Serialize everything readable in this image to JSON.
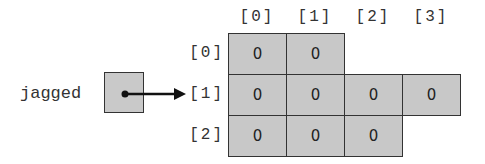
{
  "diagram": {
    "variable_name": "jagged",
    "column_headers": [
      "[0]",
      "[1]",
      "[2]",
      "[3]"
    ],
    "row_labels": [
      "[0]",
      "[1]",
      "[2]"
    ],
    "rows": [
      [
        "0",
        "0"
      ],
      [
        "0",
        "0",
        "0",
        "0"
      ],
      [
        "0",
        "0",
        "0"
      ]
    ],
    "pointer_target_row": 1,
    "colors": {
      "cell_fill": "#c8c8c8",
      "border": "#333333",
      "background": "#ffffff"
    }
  }
}
